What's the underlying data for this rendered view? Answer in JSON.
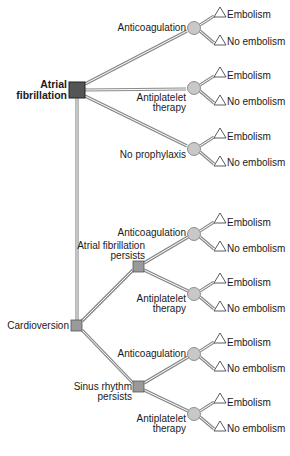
{
  "diagram": {
    "type": "decision-tree",
    "colors": {
      "decision_root": "#555555",
      "decision_node": "#9a9a9a",
      "chance_node": "#c8c8c8",
      "branch": "#8a8a8a",
      "terminal": "#ffffff"
    },
    "root": {
      "label_line1": "Atrial",
      "label_line2": "fibrillation"
    },
    "first_level": [
      {
        "label": "Anticoagulation",
        "outcomes": [
          "Embolism",
          "No embolism"
        ]
      },
      {
        "label_line1": "Antiplatelet",
        "label_line2": "therapy",
        "outcomes": [
          "Embolism",
          "No embolism"
        ]
      },
      {
        "label": "No prophylaxis",
        "outcomes": [
          "Embolism",
          "No embolism"
        ]
      }
    ],
    "cardioversion": {
      "label": "Cardioversion",
      "states": [
        {
          "label_line1": "Atrial fibrillation",
          "label_line2": "persists",
          "options": [
            {
              "label": "Anticoagulation",
              "outcomes": [
                "Embolism",
                "No embolism"
              ]
            },
            {
              "label_line1": "Antiplatelet",
              "label_line2": "therapy",
              "outcomes": [
                "Embolism",
                "No embolism"
              ]
            }
          ]
        },
        {
          "label_line1": "Sinus rhythm",
          "label_line2": "persists",
          "options": [
            {
              "label": "Anticoagulation",
              "outcomes": [
                "Embolism",
                "No embolism"
              ]
            },
            {
              "label_line1": "Antiplatelet",
              "label_line2": "therapy",
              "outcomes": [
                "Embolism",
                "No embolism"
              ]
            }
          ]
        }
      ]
    }
  }
}
